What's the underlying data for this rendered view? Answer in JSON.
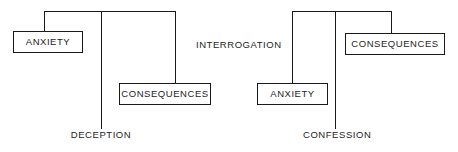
{
  "diagram": {
    "type": "tree-diagram",
    "title": "",
    "stroke_color": "#1a1a1a",
    "text_color": "#1d1d1d",
    "background_color": "#ffffff",
    "trees": [
      {
        "id": "deception-tree",
        "root_label": "DECEPTION",
        "branches": [
          "ANXIETY",
          "CONSEQUENCES"
        ]
      },
      {
        "id": "confession-tree",
        "root_label": "CONFESSION",
        "branches": [
          "ANXIETY",
          "CONSEQUENCES"
        ]
      }
    ],
    "center_label": "INTERROGATION",
    "nodes": {
      "left_anxiety": "ANXIETY",
      "left_consequences": "CONSEQUENCES",
      "right_anxiety": "ANXIETY",
      "right_consequences": "CONSEQUENCES"
    },
    "root_labels": {
      "left": "DECEPTION",
      "right": "CONFESSION"
    }
  }
}
